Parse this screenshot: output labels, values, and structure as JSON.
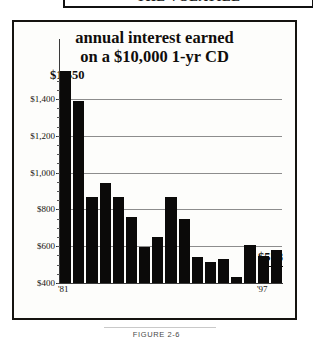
{
  "top_banner": {
    "text": "THE VOLATILE"
  },
  "figure": {
    "caption": "FIGURE 2-6"
  },
  "chart_data": {
    "type": "bar",
    "title": "annual interest earned on a $10,000 1-yr CD",
    "title_line1": "annual interest earned",
    "title_line2": "on a $10,000 1-yr CD",
    "xlabel": "",
    "ylabel": "",
    "ylim": [
      400,
      1550
    ],
    "grid": true,
    "legend": "none",
    "categories": [
      "'81",
      "'82",
      "'83",
      "'84",
      "'85",
      "'86",
      "'87",
      "'88",
      "'89",
      "'90",
      "'91",
      "'92",
      "'93",
      "'94",
      "'95",
      "'96",
      "'97"
    ],
    "values": [
      1550,
      1390,
      870,
      945,
      865,
      760,
      595,
      650,
      865,
      750,
      540,
      515,
      530,
      432,
      608,
      545,
      578
    ],
    "ytick_labels": [
      "$1,400",
      "$1,200",
      "$1,000",
      "$800",
      "$600",
      "$400"
    ],
    "ytick_values": [
      1400,
      1200,
      1000,
      800,
      600,
      400
    ],
    "visible_xtick_labels": [
      "'81",
      "'97"
    ],
    "annotations": [
      {
        "name": "max-value",
        "text": "$1,550",
        "value": 1550,
        "category": "'81"
      },
      {
        "name": "last-value",
        "text": "$578",
        "value": 578,
        "category": "'97"
      }
    ],
    "bar_color": "#0b0a09",
    "grid_color": "#8d8d8d",
    "background": "#fdfdfb"
  }
}
